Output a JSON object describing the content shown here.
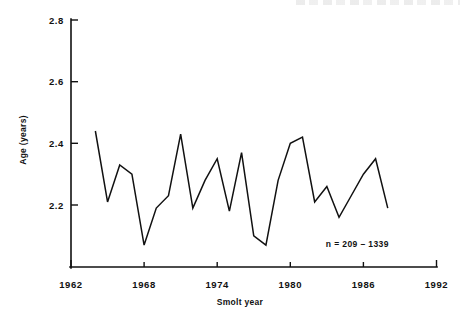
{
  "chart_data": {
    "type": "line",
    "title": "",
    "subtitle": "",
    "xlabel": "Smolt year",
    "ylabel": "Age (years)",
    "xlim": [
      1962,
      1992
    ],
    "ylim": [
      2.0,
      2.8
    ],
    "xticks": [
      1962,
      1968,
      1974,
      1980,
      1986,
      1992
    ],
    "xtick_labels": [
      "1962",
      "1968",
      "1974",
      "1980",
      "1986",
      "1992"
    ],
    "yticks": [
      2.2,
      2.4,
      2.6,
      2.8
    ],
    "ytick_labels": [
      "2.2",
      "2.4",
      "2.6",
      "2.8"
    ],
    "grid": false,
    "legend": "none",
    "annotations": [
      {
        "name": "sample-size-note",
        "text": "n = 209 – 1339",
        "x": 1985.5,
        "y": 2.065
      }
    ],
    "series": [
      {
        "name": "Mean smolt age",
        "color": "#111111",
        "x": [
          1964,
          1965,
          1966,
          1967,
          1968,
          1969,
          1970,
          1971,
          1972,
          1973,
          1974,
          1975,
          1976,
          1977,
          1978,
          1979,
          1980,
          1981,
          1982,
          1983,
          1984,
          1985,
          1986,
          1987,
          1988
        ],
        "values": [
          2.44,
          2.21,
          2.33,
          2.3,
          2.07,
          2.19,
          2.23,
          2.43,
          2.19,
          2.28,
          2.35,
          2.18,
          2.37,
          2.1,
          2.07,
          2.28,
          2.4,
          2.42,
          2.21,
          2.26,
          2.16,
          2.23,
          2.3,
          2.35,
          2.19
        ]
      }
    ]
  },
  "axes": {
    "y_axis_name": "age-years-axis",
    "x_axis_name": "smolt-year-axis"
  }
}
